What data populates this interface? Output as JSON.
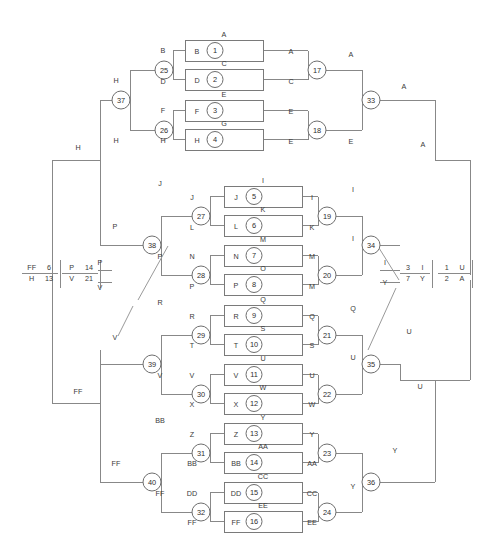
{
  "diagram": {
    "canvas": {
      "width": 492,
      "height": 547
    },
    "colors": {
      "wire": "#888888",
      "box_stroke": "#7a7a7a",
      "node_stroke": "#6e6e6e",
      "text": "#3a3a3a",
      "background": "#ffffff"
    },
    "units": [
      {
        "id": 1,
        "top_label": "A",
        "in_label": "B",
        "x": 185,
        "y": 40,
        "w": 78,
        "h": 21
      },
      {
        "id": 2,
        "top_label": "C",
        "in_label": "D",
        "x": 185,
        "y": 69,
        "w": 78,
        "h": 21
      },
      {
        "id": 3,
        "top_label": "E",
        "in_label": "F",
        "x": 185,
        "y": 100,
        "w": 78,
        "h": 21
      },
      {
        "id": 4,
        "top_label": "G",
        "in_label": "H",
        "x": 185,
        "y": 129,
        "w": 78,
        "h": 21
      },
      {
        "id": 5,
        "top_label": "I",
        "in_label": "J",
        "x": 224,
        "y": 186,
        "w": 78,
        "h": 21
      },
      {
        "id": 6,
        "top_label": "K",
        "in_label": "L",
        "x": 224,
        "y": 215,
        "w": 78,
        "h": 21
      },
      {
        "id": 7,
        "top_label": "M",
        "in_label": "N",
        "x": 224,
        "y": 245,
        "w": 78,
        "h": 21
      },
      {
        "id": 8,
        "top_label": "O",
        "in_label": "P",
        "x": 224,
        "y": 274,
        "w": 78,
        "h": 21
      },
      {
        "id": 9,
        "top_label": "Q",
        "in_label": "R",
        "x": 224,
        "y": 305,
        "w": 78,
        "h": 21
      },
      {
        "id": 10,
        "top_label": "S",
        "in_label": "T",
        "x": 224,
        "y": 334,
        "w": 78,
        "h": 21
      },
      {
        "id": 11,
        "top_label": "U",
        "in_label": "V",
        "x": 224,
        "y": 364,
        "w": 78,
        "h": 21
      },
      {
        "id": 12,
        "top_label": "W",
        "in_label": "X",
        "x": 224,
        "y": 393,
        "w": 78,
        "h": 21
      },
      {
        "id": 13,
        "top_label": "Y",
        "in_label": "Z",
        "x": 224,
        "y": 423,
        "w": 78,
        "h": 21
      },
      {
        "id": 14,
        "top_label": "AA",
        "in_label": "BB",
        "x": 224,
        "y": 452,
        "w": 78,
        "h": 21
      },
      {
        "id": 15,
        "top_label": "CC",
        "in_label": "DD",
        "x": 224,
        "y": 482,
        "w": 78,
        "h": 21
      },
      {
        "id": 16,
        "top_label": "EE",
        "in_label": "FF",
        "x": 224,
        "y": 511,
        "w": 78,
        "h": 21
      }
    ],
    "nodes": [
      {
        "id": 17,
        "cx": 317,
        "cy": 70,
        "r": 9
      },
      {
        "id": 18,
        "cx": 317,
        "cy": 130,
        "r": 9
      },
      {
        "id": 19,
        "cx": 327,
        "cy": 216,
        "r": 9
      },
      {
        "id": 20,
        "cx": 327,
        "cy": 275,
        "r": 9
      },
      {
        "id": 21,
        "cx": 327,
        "cy": 335,
        "r": 9
      },
      {
        "id": 22,
        "cx": 327,
        "cy": 394,
        "r": 9
      },
      {
        "id": 23,
        "cx": 327,
        "cy": 453,
        "r": 9
      },
      {
        "id": 24,
        "cx": 327,
        "cy": 512,
        "r": 9
      },
      {
        "id": 25,
        "cx": 164,
        "cy": 70,
        "r": 9
      },
      {
        "id": 26,
        "cx": 164,
        "cy": 130,
        "r": 9
      },
      {
        "id": 27,
        "cx": 201,
        "cy": 216,
        "r": 9
      },
      {
        "id": 28,
        "cx": 201,
        "cy": 275,
        "r": 9
      },
      {
        "id": 29,
        "cx": 201,
        "cy": 335,
        "r": 9
      },
      {
        "id": 30,
        "cx": 201,
        "cy": 394,
        "r": 9
      },
      {
        "id": 31,
        "cx": 201,
        "cy": 453,
        "r": 9
      },
      {
        "id": 32,
        "cx": 201,
        "cy": 512,
        "r": 9
      },
      {
        "id": 33,
        "cx": 371,
        "cy": 100,
        "r": 9
      },
      {
        "id": 34,
        "cx": 371,
        "cy": 245,
        "r": 9
      },
      {
        "id": 35,
        "cx": 371,
        "cy": 364,
        "r": 9
      },
      {
        "id": 36,
        "cx": 371,
        "cy": 482,
        "r": 9
      },
      {
        "id": 37,
        "cx": 121,
        "cy": 100,
        "r": 9
      },
      {
        "id": 38,
        "cx": 152,
        "cy": 245,
        "r": 9
      },
      {
        "id": 39,
        "cx": 152,
        "cy": 364,
        "r": 9
      },
      {
        "id": 40,
        "cx": 152,
        "cy": 482,
        "r": 9
      }
    ],
    "wire_labels": [
      {
        "text": "B",
        "x": 163,
        "y": 53
      },
      {
        "text": "D",
        "x": 163,
        "y": 84
      },
      {
        "text": "F",
        "x": 163,
        "y": 113
      },
      {
        "text": "H",
        "x": 163,
        "y": 143
      },
      {
        "text": "A",
        "x": 291,
        "y": 54
      },
      {
        "text": "C",
        "x": 291,
        "y": 84
      },
      {
        "text": "E",
        "x": 291,
        "y": 114
      },
      {
        "text": "E",
        "x": 291,
        "y": 144
      },
      {
        "text": "A",
        "x": 351,
        "y": 57
      },
      {
        "text": "E",
        "x": 351,
        "y": 144
      },
      {
        "text": "A",
        "x": 404,
        "y": 89
      },
      {
        "text": "A",
        "x": 423,
        "y": 147
      },
      {
        "text": "H",
        "x": 116,
        "y": 83
      },
      {
        "text": "H",
        "x": 116,
        "y": 143
      },
      {
        "text": "H",
        "x": 78,
        "y": 150
      },
      {
        "text": "J",
        "x": 192,
        "y": 200
      },
      {
        "text": "L",
        "x": 192,
        "y": 230
      },
      {
        "text": "N",
        "x": 192,
        "y": 259
      },
      {
        "text": "P",
        "x": 192,
        "y": 289
      },
      {
        "text": "I",
        "x": 312,
        "y": 200
      },
      {
        "text": "K",
        "x": 312,
        "y": 230
      },
      {
        "text": "M",
        "x": 312,
        "y": 259
      },
      {
        "text": "M",
        "x": 312,
        "y": 289
      },
      {
        "text": "J",
        "x": 160,
        "y": 186
      },
      {
        "text": "P",
        "x": 115,
        "y": 229
      },
      {
        "text": "P",
        "x": 160,
        "y": 259
      },
      {
        "text": "I",
        "x": 353,
        "y": 192
      },
      {
        "text": "I",
        "x": 353,
        "y": 241
      },
      {
        "text": "R",
        "x": 192,
        "y": 319
      },
      {
        "text": "T",
        "x": 192,
        "y": 348
      },
      {
        "text": "V",
        "x": 192,
        "y": 378
      },
      {
        "text": "X",
        "x": 192,
        "y": 407
      },
      {
        "text": "Q",
        "x": 312,
        "y": 319
      },
      {
        "text": "S",
        "x": 312,
        "y": 348
      },
      {
        "text": "U",
        "x": 312,
        "y": 378
      },
      {
        "text": "W",
        "x": 312,
        "y": 407
      },
      {
        "text": "R",
        "x": 160,
        "y": 305
      },
      {
        "text": "V",
        "x": 160,
        "y": 378
      },
      {
        "text": "V",
        "x": 115,
        "y": 340
      },
      {
        "text": "Q",
        "x": 353,
        "y": 311
      },
      {
        "text": "U",
        "x": 353,
        "y": 360
      },
      {
        "text": "U",
        "x": 420,
        "y": 389
      },
      {
        "text": "Z",
        "x": 192,
        "y": 437
      },
      {
        "text": "BB",
        "x": 192,
        "y": 466
      },
      {
        "text": "DD",
        "x": 192,
        "y": 496
      },
      {
        "text": "FF",
        "x": 192,
        "y": 525
      },
      {
        "text": "Y",
        "x": 312,
        "y": 437
      },
      {
        "text": "AA",
        "x": 312,
        "y": 466
      },
      {
        "text": "CC",
        "x": 312,
        "y": 496
      },
      {
        "text": "EE",
        "x": 312,
        "y": 525
      },
      {
        "text": "BB",
        "x": 160,
        "y": 423
      },
      {
        "text": "FF",
        "x": 160,
        "y": 496
      },
      {
        "text": "FF",
        "x": 116,
        "y": 466
      },
      {
        "text": "FF",
        "x": 78,
        "y": 394
      },
      {
        "text": "Y",
        "x": 353,
        "y": 489
      },
      {
        "text": "Y",
        "x": 395,
        "y": 453
      },
      {
        "text": "U",
        "x": 409,
        "y": 334
      },
      {
        "text": "P",
        "x": 100,
        "y": 265
      },
      {
        "text": "V",
        "x": 100,
        "y": 290
      },
      {
        "text": "I",
        "x": 385,
        "y": 265
      },
      {
        "text": "Y",
        "x": 385,
        "y": 285
      }
    ],
    "legend_blocks": [
      {
        "name": "left-outer-legend",
        "x": 22,
        "y": 264,
        "w": 36,
        "h": 18,
        "cells": [
          {
            "text": "FF",
            "col": 0,
            "row": 0
          },
          {
            "text": "6",
            "col": 1,
            "row": 0
          },
          {
            "text": "H",
            "col": 0,
            "row": 1
          },
          {
            "text": "13",
            "col": 1,
            "row": 1
          }
        ]
      },
      {
        "name": "left-inner-legend",
        "x": 62,
        "y": 264,
        "w": 36,
        "h": 18,
        "cells": [
          {
            "text": "P",
            "col": 0,
            "row": 0
          },
          {
            "text": "14",
            "col": 1,
            "row": 0
          },
          {
            "text": "V",
            "col": 0,
            "row": 1
          },
          {
            "text": "21",
            "col": 1,
            "row": 1
          }
        ]
      },
      {
        "name": "right-inner-legend",
        "x": 400,
        "y": 264,
        "w": 30,
        "h": 18,
        "cells": [
          {
            "text": "3",
            "col": 0,
            "row": 0
          },
          {
            "text": "I",
            "col": 1,
            "row": 0
          },
          {
            "text": "7",
            "col": 0,
            "row": 1
          },
          {
            "text": "Y",
            "col": 1,
            "row": 1
          }
        ]
      },
      {
        "name": "right-outer-legend",
        "x": 438,
        "y": 264,
        "w": 32,
        "h": 18,
        "cells": [
          {
            "text": "1",
            "col": 0,
            "row": 0
          },
          {
            "text": "U",
            "col": 1,
            "row": 0
          },
          {
            "text": "2",
            "col": 0,
            "row": 1
          },
          {
            "text": "A",
            "col": 1,
            "row": 1
          }
        ]
      }
    ]
  }
}
